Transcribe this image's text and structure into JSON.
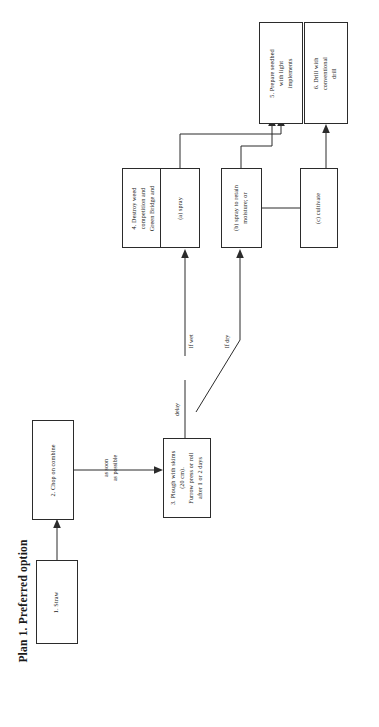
{
  "figure": {
    "title": "Plan 1. Preferred option",
    "orientation": "rotated-90-ccw",
    "background_color": "#ffffff",
    "line_color": "#2b2b2b",
    "text_color": "#1a1a1a"
  },
  "nodes": [
    {
      "id": "straw",
      "label": "1.  Straw"
    },
    {
      "id": "chop",
      "label": "2.  Chop on combine"
    },
    {
      "id": "plough",
      "label": "3.  Plough with skims\n(20 cm).\nFurrow press or roll\nafter 1 or 2 days"
    },
    {
      "id": "destroy",
      "label": "4.  Destroy weed\ncompetition and\nGreen Bridge and"
    },
    {
      "id": "spray",
      "label": "(a)  spray"
    },
    {
      "id": "retain",
      "label": "(b)  spray to retain\nmoisture; or"
    },
    {
      "id": "cultivate",
      "label": "(c)  cultivate"
    },
    {
      "id": "seedbed",
      "label": "5.  Prepare seedbed\nwith light\nimplements"
    },
    {
      "id": "drill",
      "label": "6.  Drill with\nconventional\ndrill"
    }
  ],
  "edge_labels": [
    {
      "id": "assoon",
      "label": "as soon\nas possible"
    },
    {
      "id": "delay",
      "label": "delay"
    },
    {
      "id": "ifwet",
      "label": "If wet"
    },
    {
      "id": "ifdry",
      "label": "If dry"
    }
  ],
  "chart_data": {
    "type": "diagram",
    "title": "Plan 1. Preferred option",
    "diagram_kind": "flowchart",
    "flow_direction": "left-to-right (rotated to bottom-to-top in frame)",
    "nodes": [
      "1. Straw",
      "2. Chop on combine",
      "3. Plough with skims (20 cm). Furrow press or roll after 1 or 2 days",
      "4. Destroy weed competition and Green Bridge and",
      "(a) spray",
      "(b) spray to retain moisture; or",
      "(c) cultivate",
      "5. Prepare seedbed with light implements",
      "6. Drill with conventional drill"
    ],
    "edges": [
      {
        "from": "1. Straw",
        "to": "2. Chop on combine",
        "label": ""
      },
      {
        "from": "2. Chop on combine",
        "to": "3. Plough with skims (20 cm). Furrow press or roll after 1 or 2 days",
        "label": "as soon as possible"
      },
      {
        "from": "3. Plough with skims (20 cm). Furrow press or roll after 1 or 2 days",
        "to": "(a) spray",
        "label": "delay / If wet"
      },
      {
        "from": "3. Plough with skims (20 cm). Furrow press or roll after 1 or 2 days",
        "to": "(b) spray to retain moisture; or",
        "label": "If dry"
      },
      {
        "from": "4. Destroy weed competition and Green Bridge and",
        "to": "(a) spray",
        "label": ""
      },
      {
        "from": "(a) spray",
        "to": "5. Prepare seedbed with light implements",
        "label": ""
      },
      {
        "from": "(b) spray to retain moisture; or",
        "to": "5. Prepare seedbed with light implements",
        "label": ""
      },
      {
        "from": "(b) spray to retain moisture; or",
        "to": "(c) cultivate",
        "label": ""
      },
      {
        "from": "(c) cultivate",
        "to": "6. Drill with conventional drill",
        "label": ""
      }
    ]
  }
}
